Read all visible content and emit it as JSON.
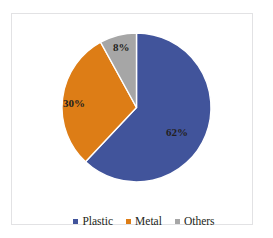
{
  "chart_data": {
    "type": "pie",
    "title": "",
    "subtitle": "",
    "xlabel": "",
    "ylabel": "",
    "grid": false,
    "legend_position": "bottom",
    "categories": [
      "Plastic",
      "Metal",
      "Others"
    ],
    "values": [
      62,
      30,
      8
    ],
    "unit": "%",
    "data_labels": [
      "62%",
      "30%",
      "8%"
    ],
    "colors": [
      "#41549b",
      "#dd7d16",
      "#a6a6a6"
    ],
    "start_angle_deg": 0,
    "direction": "clockwise",
    "slices": [
      {
        "label": "Plastic",
        "value": 62,
        "data_label": "62%",
        "color": "#41549b",
        "start_deg": 0,
        "end_deg": 223.2
      },
      {
        "label": "Metal",
        "value": 30,
        "data_label": "30%",
        "color": "#dd7d16",
        "start_deg": 223.2,
        "end_deg": 331.2
      },
      {
        "label": "Others",
        "value": 8,
        "data_label": "8%",
        "color": "#a6a6a6",
        "start_deg": 331.2,
        "end_deg": 360
      }
    ]
  },
  "legend": {
    "items": [
      {
        "label": "Plastic",
        "color": "#41549b",
        "marker": "square-marker-icon"
      },
      {
        "label": "Metal",
        "color": "#dd7d16",
        "marker": "square-marker-icon"
      },
      {
        "label": "Others",
        "color": "#a6a6a6",
        "marker": "square-marker-icon"
      }
    ]
  },
  "style": {
    "plot_background": "#ffffff",
    "frame_border_color": "#e2e2e4",
    "label_text_color": "#231f20",
    "slice_separator_color": "#ffffff"
  }
}
